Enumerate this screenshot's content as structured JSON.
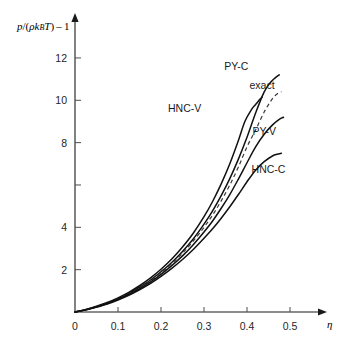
{
  "chart_data": {
    "type": "line",
    "title": "",
    "subtitle": "",
    "xlabel": "η",
    "ylabel": "p/(ρkBT) – 1",
    "ylabel_parts": {
      "numerator": "p",
      "slash": "/(",
      "rho": "ρ",
      "k": "k",
      "k_subscript": "B",
      "temperature": "T",
      "close": ")",
      "minus_one": "– 1"
    },
    "xlim": [
      0,
      0.55
    ],
    "ylim": [
      0,
      13.2
    ],
    "grid": false,
    "legend_position": "inline-curve-labels",
    "xticks": [
      0,
      0.1,
      0.2,
      0.3,
      0.4,
      0.5
    ],
    "xtick_labels": [
      "0",
      "0.1",
      "0.2",
      "0.3",
      "0.4",
      "0.5"
    ],
    "yticks": [
      2,
      4,
      6,
      8,
      10,
      12
    ],
    "ytick_labels": [
      "2",
      "4",
      "6",
      "8",
      "",
      "10",
      "12"
    ],
    "ytick_labels_shown": [
      "2",
      "4",
      "8",
      "10",
      "12"
    ],
    "ytick_unlabeled": [
      6
    ],
    "series": [
      {
        "name": "HNC-V",
        "style": "solid",
        "label_x": 0.255,
        "label_y": 9.45,
        "x": [
          0.0,
          0.025,
          0.05,
          0.075,
          0.1,
          0.125,
          0.15,
          0.175,
          0.2,
          0.225,
          0.25,
          0.275,
          0.3,
          0.32,
          0.34,
          0.36,
          0.38,
          0.395,
          0.41,
          0.42,
          0.43,
          0.435
        ],
        "y": [
          0.0,
          0.12,
          0.27,
          0.45,
          0.67,
          0.93,
          1.24,
          1.6,
          2.02,
          2.5,
          3.07,
          3.72,
          4.5,
          5.22,
          6.05,
          7.0,
          8.1,
          9.0,
          9.55,
          9.8,
          10.05,
          10.15
        ]
      },
      {
        "name": "PY-C",
        "style": "solid",
        "label_x": 0.375,
        "label_y": 11.45,
        "x": [
          0.0,
          0.025,
          0.05,
          0.075,
          0.1,
          0.125,
          0.15,
          0.175,
          0.2,
          0.225,
          0.25,
          0.275,
          0.3,
          0.32,
          0.34,
          0.36,
          0.38,
          0.4,
          0.42,
          0.44,
          0.455,
          0.465,
          0.475
        ],
        "y": [
          0.0,
          0.11,
          0.25,
          0.42,
          0.63,
          0.88,
          1.17,
          1.5,
          1.9,
          2.34,
          2.86,
          3.45,
          4.15,
          4.78,
          5.5,
          6.3,
          7.22,
          8.25,
          9.4,
          10.4,
          10.85,
          11.05,
          11.2
        ]
      },
      {
        "name": "exact",
        "style": "dashed",
        "label_x": 0.435,
        "label_y": 10.55,
        "x": [
          0.0,
          0.025,
          0.05,
          0.075,
          0.1,
          0.125,
          0.15,
          0.175,
          0.2,
          0.225,
          0.25,
          0.275,
          0.3,
          0.32,
          0.34,
          0.36,
          0.38,
          0.4,
          0.42,
          0.44,
          0.46,
          0.47,
          0.48
        ],
        "y": [
          0.0,
          0.11,
          0.25,
          0.41,
          0.62,
          0.86,
          1.14,
          1.47,
          1.85,
          2.28,
          2.78,
          3.35,
          4.0,
          4.58,
          5.25,
          6.0,
          6.85,
          7.8,
          8.6,
          9.45,
          10.1,
          10.3,
          10.4
        ]
      },
      {
        "name": "PY-V",
        "style": "solid",
        "label_x": 0.44,
        "label_y": 8.35,
        "x": [
          0.0,
          0.025,
          0.05,
          0.075,
          0.1,
          0.125,
          0.15,
          0.175,
          0.2,
          0.225,
          0.25,
          0.275,
          0.3,
          0.32,
          0.34,
          0.36,
          0.38,
          0.4,
          0.42,
          0.44,
          0.46,
          0.475,
          0.485
        ],
        "y": [
          0.0,
          0.1,
          0.24,
          0.4,
          0.6,
          0.83,
          1.1,
          1.41,
          1.78,
          2.19,
          2.65,
          3.18,
          3.78,
          4.3,
          4.9,
          5.55,
          6.28,
          7.05,
          7.8,
          8.4,
          8.85,
          9.1,
          9.2
        ]
      },
      {
        "name": "HNC-C",
        "style": "solid",
        "label_x": 0.45,
        "label_y": 6.55,
        "x": [
          0.0,
          0.025,
          0.05,
          0.075,
          0.1,
          0.125,
          0.15,
          0.175,
          0.2,
          0.225,
          0.25,
          0.275,
          0.3,
          0.32,
          0.34,
          0.36,
          0.38,
          0.4,
          0.42,
          0.44,
          0.46,
          0.47,
          0.48
        ],
        "y": [
          0.0,
          0.1,
          0.23,
          0.38,
          0.57,
          0.79,
          1.05,
          1.34,
          1.68,
          2.06,
          2.48,
          2.95,
          3.48,
          3.93,
          4.43,
          4.97,
          5.55,
          6.15,
          6.7,
          7.1,
          7.38,
          7.45,
          7.5
        ]
      }
    ]
  },
  "axes": {
    "x_axis_name": "eta-axis",
    "y_axis_name": "pressure-axis"
  }
}
